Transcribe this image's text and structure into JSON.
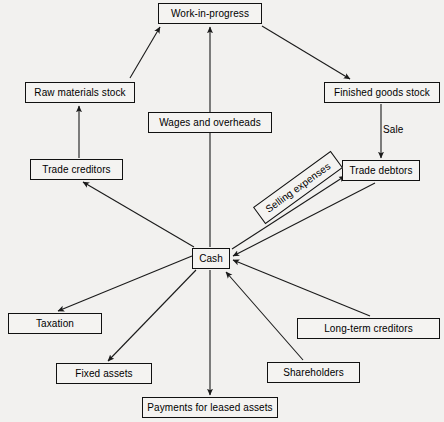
{
  "diagram": {
    "canvas": {
      "width": 444,
      "height": 422,
      "background": "#f2f1ef"
    },
    "style": {
      "box_border": "#111111",
      "box_fill": "#f4f3f1",
      "line": "#1a1a1a",
      "text": "#000000"
    },
    "nodes": [
      {
        "id": "work_in_progress",
        "label": "Work-in-progress",
        "x": 158,
        "y": 3,
        "w": 104,
        "h": 21,
        "rotate": 0
      },
      {
        "id": "raw_materials_stock",
        "label": "Raw materials stock",
        "x": 25,
        "y": 82,
        "w": 110,
        "h": 21,
        "rotate": 0
      },
      {
        "id": "finished_goods_stock",
        "label": "Finished goods stock",
        "x": 324,
        "y": 82,
        "w": 116,
        "h": 21,
        "rotate": 0
      },
      {
        "id": "wages_and_overheads",
        "label": "Wages and overheads",
        "x": 148,
        "y": 112,
        "w": 124,
        "h": 21,
        "rotate": 0
      },
      {
        "id": "trade_creditors",
        "label": "Trade creditors",
        "x": 30,
        "y": 159,
        "w": 93,
        "h": 21,
        "rotate": 0
      },
      {
        "id": "trade_debtors",
        "label": "Trade debtors",
        "x": 342,
        "y": 160,
        "w": 78,
        "h": 21,
        "rotate": 0
      },
      {
        "id": "selling_expenses",
        "label": "Selling expenses",
        "x": 250,
        "y": 177,
        "w": 96,
        "h": 21,
        "rotate": -36
      },
      {
        "id": "cash",
        "label": "Cash",
        "x": 192,
        "y": 248,
        "w": 38,
        "h": 21,
        "rotate": 0
      },
      {
        "id": "taxation",
        "label": "Taxation",
        "x": 8,
        "y": 313,
        "w": 94,
        "h": 21,
        "rotate": 0
      },
      {
        "id": "long_term_creditors",
        "label": "Long-term creditors",
        "x": 297,
        "y": 318,
        "w": 143,
        "h": 21,
        "rotate": 0
      },
      {
        "id": "fixed_assets",
        "label": "Fixed assets",
        "x": 56,
        "y": 363,
        "w": 96,
        "h": 21,
        "rotate": 0
      },
      {
        "id": "shareholders",
        "label": "Shareholders",
        "x": 267,
        "y": 362,
        "w": 93,
        "h": 21,
        "rotate": 0
      },
      {
        "id": "payments_leased_assets",
        "label": "Payments for leased assets",
        "x": 142,
        "y": 397,
        "w": 136,
        "h": 21,
        "rotate": 0
      }
    ],
    "free_labels": [
      {
        "id": "sale_label",
        "label": "Sale",
        "x": 383,
        "y": 124
      }
    ],
    "edges": [
      {
        "id": "raw-to-wip",
        "from": "raw_materials_stock",
        "to": "work_in_progress",
        "x1": 130,
        "y1": 78,
        "x2": 160,
        "y2": 27,
        "arrow": "end"
      },
      {
        "id": "wages-to-wip",
        "from": "wages_and_overheads",
        "to": "work_in_progress",
        "x1": 210,
        "y1": 112,
        "x2": 210,
        "y2": 27,
        "arrow": "end"
      },
      {
        "id": "wip-to-finished",
        "from": "work_in_progress",
        "to": "finished_goods_stock",
        "x1": 262,
        "y1": 26,
        "x2": 350,
        "y2": 79,
        "arrow": "end"
      },
      {
        "id": "creditors-to-raw",
        "from": "trade_creditors",
        "to": "raw_materials_stock",
        "x1": 79,
        "y1": 158,
        "x2": 79,
        "y2": 106,
        "arrow": "end"
      },
      {
        "id": "finished-to-debtors",
        "from": "finished_goods_stock",
        "to": "trade_debtors",
        "x1": 381,
        "y1": 104,
        "x2": 381,
        "y2": 158,
        "arrow": "end"
      },
      {
        "id": "cash-to-creditors",
        "from": "cash",
        "to": "trade_creditors",
        "x1": 194,
        "y1": 247,
        "x2": 83,
        "y2": 182,
        "arrow": "end"
      },
      {
        "id": "cash-to-selling",
        "from": "cash",
        "to": "selling_expenses",
        "x1": 232,
        "y1": 249,
        "x2": 345,
        "y2": 176,
        "arrow": "end"
      },
      {
        "id": "debtors-to-cash",
        "from": "trade_debtors",
        "to": "cash",
        "x1": 375,
        "y1": 183,
        "x2": 233,
        "y2": 256,
        "arrow": "end"
      },
      {
        "id": "cash-to-wages",
        "from": "cash",
        "to": "wages_and_overheads",
        "x1": 210,
        "y1": 247,
        "x2": 210,
        "y2": 133,
        "arrow": "none"
      },
      {
        "id": "cash-to-taxation",
        "from": "cash",
        "to": "taxation",
        "x1": 192,
        "y1": 256,
        "x2": 58,
        "y2": 311,
        "arrow": "end"
      },
      {
        "id": "cash-to-fixed",
        "from": "cash",
        "to": "fixed_assets",
        "x1": 196,
        "y1": 270,
        "x2": 108,
        "y2": 361,
        "arrow": "end"
      },
      {
        "id": "cash-to-leased",
        "from": "cash",
        "to": "payments_leased_assets",
        "x1": 210,
        "y1": 270,
        "x2": 210,
        "y2": 395,
        "arrow": "end"
      },
      {
        "id": "shareholders-to-cash",
        "from": "shareholders",
        "to": "cash",
        "x1": 303,
        "y1": 360,
        "x2": 226,
        "y2": 272,
        "arrow": "end"
      },
      {
        "id": "longterm-to-cash",
        "from": "long_term_creditors",
        "to": "cash",
        "x1": 370,
        "y1": 316,
        "x2": 233,
        "y2": 260,
        "arrow": "end"
      }
    ]
  }
}
